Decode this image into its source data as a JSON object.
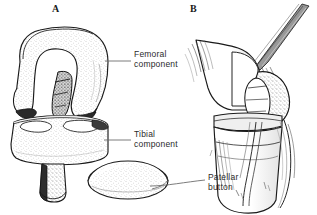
{
  "figure": {
    "background_color": "#ffffff",
    "ink_color": "#1a1a1a",
    "leader_color": "#6d6d6d",
    "stipple_color": "#7a7a7a",
    "style": "pen-and-ink stippled medical illustration"
  },
  "panels": [
    {
      "letter": "A",
      "name": "disassembled-components",
      "description": "Exploded view of knee prosthesis components"
    },
    {
      "letter": "B",
      "name": "implanted-lateral-view",
      "description": "Lateral view of knee with components implanted"
    }
  ],
  "callouts": [
    {
      "id": "femoral",
      "text": "Femoral\ncomponent",
      "line1": "Femoral",
      "line2": "component"
    },
    {
      "id": "tibial",
      "text": "Tibial\ncomponent",
      "line1": "Tibial",
      "line2": "component"
    },
    {
      "id": "patellar",
      "text": "Patellar\nbutton",
      "line1": "Patellar",
      "line2": "button"
    }
  ],
  "anatomy": {
    "panel_a_parts": [
      "femoral component",
      "tibial component",
      "tibial stem",
      "patellar button"
    ],
    "panel_b_parts": [
      "quadriceps tendon",
      "femur",
      "patella",
      "tibia",
      "patellar tendon",
      "fibula"
    ]
  }
}
